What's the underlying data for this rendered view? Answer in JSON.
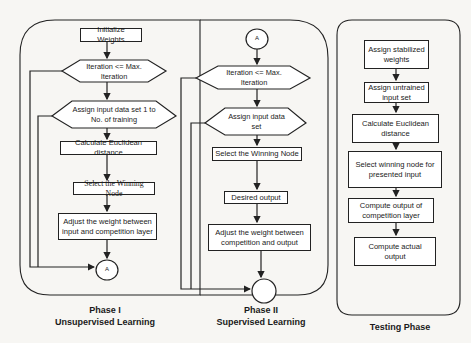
{
  "colors": {
    "stroke": "#222222",
    "background": "#f7f6f3",
    "node_fill": "#ffffff"
  },
  "phase1": {
    "caption_line1": "Phase I",
    "caption_line2": "Unsupervised Learning",
    "nodes": {
      "init": "Initialize Weights",
      "iter": "Iteration <= Max. Iteration",
      "assign": "Assign input data set 1 to No. of training",
      "euclid": "Calculate Euclidean distance",
      "winner": "Select the Winning Node",
      "adjust": "Adjust the weight between input and competition layer",
      "connector": "A"
    }
  },
  "phase2": {
    "caption_line1": "Phase II",
    "caption_line2": "Supervised Learning",
    "nodes": {
      "connector": "A",
      "iter": "Iteration <= Max. Iteration",
      "assign": "Assign input data set",
      "winner": "Select the Winning Node",
      "desired": "Desired output",
      "adjust": "Adjust the weight between competition and output",
      "end": ""
    }
  },
  "testing": {
    "caption": "Testing Phase",
    "nodes": {
      "stabilized": "Assign stabilized weights",
      "untrained": "Assign untrained input set",
      "euclid": "Calculate Euclidean distance",
      "winner": "Select winning node for presented input",
      "competition": "Compute output of competition layer",
      "actual": "Compute actual output"
    }
  }
}
